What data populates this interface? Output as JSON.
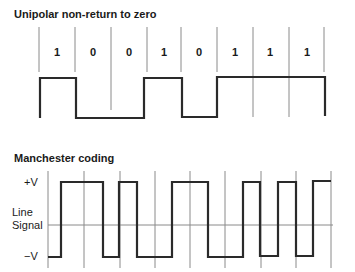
{
  "diagram": {
    "nrz": {
      "title": "Unipolar non-return to zero",
      "bits": [
        "1",
        "0",
        "0",
        "1",
        "0",
        "1",
        "1",
        "1"
      ]
    },
    "manchester": {
      "title": "Manchester coding",
      "labels": {
        "plus_v": "+V",
        "line": "Line",
        "signal": "Signal",
        "minus_v": "−V"
      }
    },
    "colors": {
      "waveform": "#2a2a2a",
      "gridline": "#8a8a8a"
    }
  }
}
